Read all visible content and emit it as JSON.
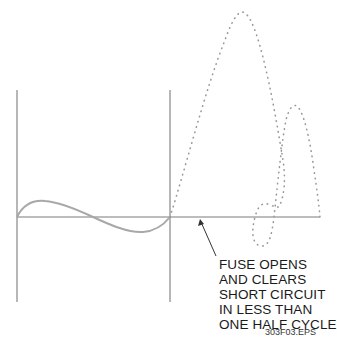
{
  "diagram": {
    "colors": {
      "axis": "#6f6f6f",
      "normal_current": "#a8a8a8",
      "prospective_fault_current": "#999999",
      "text": "#1a1a1a"
    },
    "annotation": {
      "lines": [
        "FUSE OPENS",
        "AND CLEARS",
        "SHORT CIRCUIT",
        "IN LESS THAN",
        "ONE HALF CYCLE"
      ]
    },
    "caption": "303F03.EPS"
  }
}
